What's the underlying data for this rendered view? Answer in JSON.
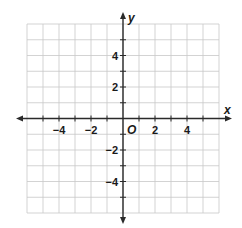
{
  "chart_data": {
    "type": "coordinate-grid",
    "title": "",
    "xlabel": "x",
    "ylabel": "y",
    "origin_label": "O",
    "xlim": [
      -6,
      6
    ],
    "ylim": [
      -6,
      6
    ],
    "grid": true,
    "grid_step": 1,
    "x_tick_labels": [
      {
        "value": -4,
        "text": "−4"
      },
      {
        "value": -2,
        "text": "−2"
      },
      {
        "value": 2,
        "text": "2"
      },
      {
        "value": 4,
        "text": "4"
      }
    ],
    "y_tick_labels": [
      {
        "value": 4,
        "text": "4"
      },
      {
        "value": 2,
        "text": "2"
      },
      {
        "value": -2,
        "text": "−2"
      },
      {
        "value": -4,
        "text": "−4"
      }
    ],
    "colors": {
      "grid": "#c8c8c8",
      "axis": "#2a2a2a",
      "label": "#1a1a1a"
    },
    "series": []
  }
}
